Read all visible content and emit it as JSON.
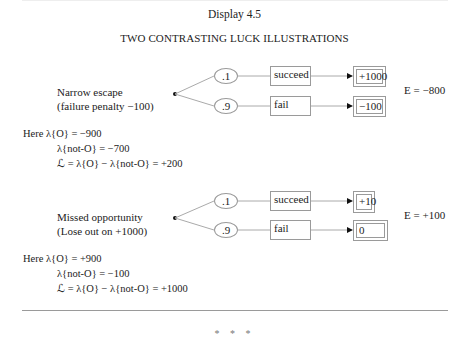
{
  "header": {
    "display_label": "Display 4.5",
    "title": "TWO CONTRASTING LUCK ILLUSTRATIONS"
  },
  "illustrations": [
    {
      "name": "Narrow escape",
      "subtitle": "(failure penalty −100)",
      "branches": [
        {
          "probability": ".1",
          "event": "succeed",
          "outcome": "+1000"
        },
        {
          "probability": ".9",
          "event": "fail",
          "outcome": "−100"
        }
      ],
      "expected_value": "E = −800",
      "calc": {
        "line1": "Here λ{O} = −900",
        "line2": "λ{not-O} = −700",
        "line3": "ℒ = λ{O} − λ{not-O} = +200"
      }
    },
    {
      "name": "Missed opportunity",
      "subtitle": "(Lose out on +1000)",
      "branches": [
        {
          "probability": ".1",
          "event": "succeed",
          "outcome": "+10"
        },
        {
          "probability": ".9",
          "event": "fail",
          "outcome": "0"
        }
      ],
      "expected_value": "E = +100",
      "calc": {
        "line1": "Here λ{O} = +900",
        "line2": "λ{not-O} = −100",
        "line3": "ℒ = λ{O} − λ{not-O} = +1000"
      }
    }
  ],
  "footer": {
    "separator": "* * *"
  }
}
